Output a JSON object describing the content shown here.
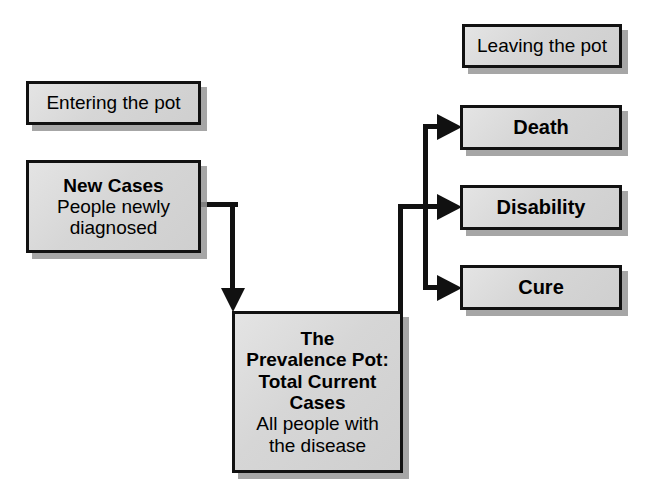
{
  "diagram": {
    "title": "The Prevalence Pot",
    "colors": {
      "box_fill": "#d6d6d6",
      "box_border": "#111111",
      "shadow": "#969696",
      "connector": "#111111",
      "background": "#ffffff",
      "text": "#000000"
    },
    "nodes": {
      "entering": {
        "id": "entering-the-pot",
        "lines": [
          {
            "text": "Entering the pot",
            "style": "regular"
          }
        ]
      },
      "new_cases": {
        "id": "new-cases",
        "lines": [
          {
            "text": "New Cases",
            "style": "bold"
          },
          {
            "text": "People newly",
            "style": "regular"
          },
          {
            "text": "diagnosed",
            "style": "regular"
          }
        ]
      },
      "prevalence_pot": {
        "id": "prevalence-pot",
        "lines": [
          {
            "text": "The",
            "style": "bold"
          },
          {
            "text": "Prevalence Pot:",
            "style": "bold"
          },
          {
            "text": "Total Current",
            "style": "bold"
          },
          {
            "text": "Cases",
            "style": "bold"
          },
          {
            "text": "All people with",
            "style": "regular"
          },
          {
            "text": "the disease",
            "style": "regular"
          }
        ]
      },
      "leaving": {
        "id": "leaving-the-pot",
        "lines": [
          {
            "text": "Leaving the pot",
            "style": "regular"
          }
        ]
      },
      "death": {
        "id": "death",
        "lines": [
          {
            "text": "Death",
            "style": "bold"
          }
        ]
      },
      "disability": {
        "id": "disability",
        "lines": [
          {
            "text": "Disability",
            "style": "bold"
          }
        ]
      },
      "cure": {
        "id": "cure",
        "lines": [
          {
            "text": "Cure",
            "style": "bold"
          }
        ]
      }
    },
    "edges": [
      {
        "from": "new_cases",
        "to": "prevalence_pot",
        "marker": "arrow-down"
      },
      {
        "from": "prevalence_pot",
        "to": "death",
        "marker": "arrow-right"
      },
      {
        "from": "prevalence_pot",
        "to": "disability",
        "marker": "arrow-right"
      },
      {
        "from": "prevalence_pot",
        "to": "cure",
        "marker": "arrow-right"
      }
    ]
  }
}
